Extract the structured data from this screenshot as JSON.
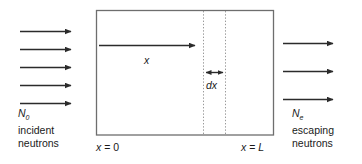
{
  "figure": {
    "colors": {
      "stroke": "#2b2b2b",
      "box_border": "#6e6e6e",
      "dotted": "#9a9a9a",
      "text": "#1a1a1a",
      "background": "#ffffff"
    }
  },
  "left_label": {
    "symbol": "N",
    "subscript": "0",
    "line1": "incident",
    "line2": "neutrons"
  },
  "right_label": {
    "symbol": "N",
    "subscript": "e",
    "line1": "escaping",
    "line2": "neutrons"
  },
  "axis_labels": {
    "origin_var": "x",
    "origin_eq": " = ",
    "origin_value": "0",
    "end_var": "x",
    "end_eq": " = ",
    "end_value": "L"
  },
  "inner_labels": {
    "depth": "x",
    "thickness": "dx"
  },
  "arrows": {
    "incident_label": "incident neutron arrows",
    "incident_count": 5,
    "escaping_label": "escaping neutron arrows",
    "escaping_count": 3,
    "depth_label": "depth arrow x",
    "thickness_label": "thickness double arrow dx"
  },
  "slab": {
    "name": "slab-region",
    "left_x": 96,
    "right_x": 274,
    "top_y": 10,
    "bottom_y": 135,
    "dotted_line_1_x": 203,
    "dotted_line_2_x": 225
  }
}
